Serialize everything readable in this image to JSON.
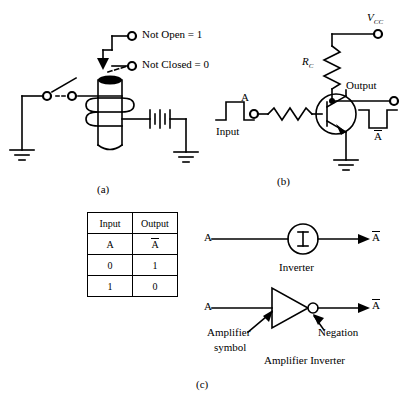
{
  "figure": {
    "panel_labels": {
      "a": "(a)",
      "b": "(b)",
      "c": "(c)"
    },
    "background_color": "#ffffff",
    "ink_color": "#000000"
  },
  "panel_a": {
    "caption": "(a)",
    "title_note": "relay contact inverter",
    "terminal_labels": [
      {
        "name": "not-open",
        "text": "Not Open = 1"
      },
      {
        "name": "not-closed",
        "text": "Not Closed = 0"
      }
    ],
    "components": [
      "switch",
      "solenoid-coil",
      "battery",
      "ground-left",
      "ground-right",
      "terminal-upper",
      "terminal-lower",
      "actuator-arrow",
      "dashed-linkage"
    ]
  },
  "panel_b": {
    "caption": "(b)",
    "title_note": "transistor inverter",
    "supply_label": "V",
    "supply_subscript": "CC",
    "resistor_label": "R",
    "resistor_subscript": "C",
    "output_label": "Output",
    "input_label": "Input",
    "input_node_label": "A",
    "output_waveform_label": "A",
    "output_waveform_label_complement": true,
    "input_waveform": {
      "type": "pulse",
      "polarity": "positive",
      "levels": [
        0,
        1,
        0
      ]
    },
    "output_waveform": {
      "type": "pulse",
      "polarity": "negative",
      "levels": [
        1,
        0,
        1
      ]
    },
    "components": [
      "resistor-collector",
      "resistor-base",
      "npn-transistor",
      "ground",
      "supply-terminal",
      "output-terminal",
      "input-terminal"
    ]
  },
  "panel_c": {
    "caption": "(c)",
    "truth_table": {
      "headers": [
        "Input",
        "Output"
      ],
      "symbol_row": [
        "A",
        "A"
      ],
      "symbol_row_complement": [
        false,
        true
      ],
      "rows": [
        [
          "0",
          "1"
        ],
        [
          "1",
          "0"
        ]
      ]
    },
    "inverter_symbol": {
      "input_label": "A",
      "output_label": "A",
      "output_complement": true,
      "glyph": "I",
      "caption": "Inverter"
    },
    "amplifier_inverter_symbol": {
      "input_label": "A",
      "output_label": "A",
      "output_complement": true,
      "annotations": [
        {
          "name": "amplifier-symbol",
          "line1": "Amplifier",
          "line2": "symbol"
        },
        {
          "name": "negation",
          "text": "Negation"
        }
      ],
      "caption": "Amplifier Inverter"
    }
  }
}
